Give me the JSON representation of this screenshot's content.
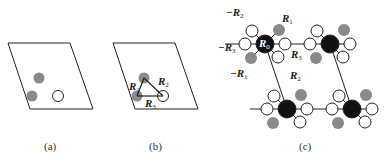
{
  "figure": {
    "panels": [
      {
        "id": "a",
        "caption": "(a)"
      },
      {
        "id": "b",
        "caption": "(b)",
        "labels": {
          "r1": "R",
          "r1_sub": "1",
          "r2": "R",
          "r2_sub": "2",
          "r3": "R",
          "r3_sub": "3"
        }
      },
      {
        "id": "c",
        "caption": "(c)",
        "labels": {
          "neg_r2": "−R",
          "neg_r2_sub": "2",
          "r1": "R",
          "r1_sub": "1",
          "neg_r3": "−R",
          "neg_r3_sub": "3",
          "r0": "R",
          "r0_sub": "0",
          "r3": "R",
          "r3_sub": "3",
          "neg_r1": "−R",
          "neg_r1_sub": "1",
          "r2": "R",
          "r2_sub": "2"
        }
      }
    ],
    "colors": {
      "gray_atom": "#8a8a8a",
      "black_atom": "#111111",
      "line": "#222222"
    }
  }
}
